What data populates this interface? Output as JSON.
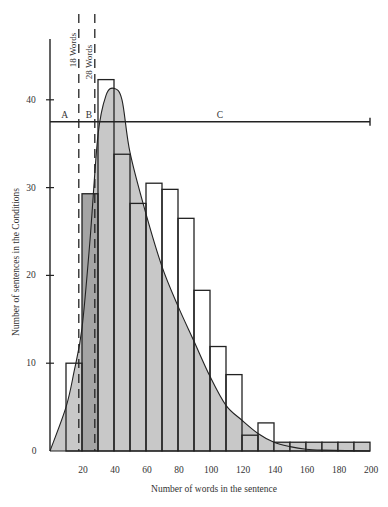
{
  "chart_data": {
    "type": "bar",
    "title": "",
    "xlabel": "Number of words in the sentence",
    "ylabel": "Number of sentences in the Conditions",
    "xlim": [
      0,
      200
    ],
    "ylim": [
      0,
      45
    ],
    "xticks": [
      20,
      40,
      60,
      80,
      100,
      120,
      140,
      160,
      180,
      200
    ],
    "yticks": [
      0,
      10,
      20,
      30,
      40
    ],
    "bins": [
      {
        "start": 10,
        "end": 20,
        "value": 10
      },
      {
        "start": 20,
        "end": 30,
        "value": 29.3
      },
      {
        "start": 30,
        "end": 40,
        "value": 42.3
      },
      {
        "start": 40,
        "end": 50,
        "value": 33.8
      },
      {
        "start": 50,
        "end": 60,
        "value": 28.2
      },
      {
        "start": 60,
        "end": 70,
        "value": 30.5
      },
      {
        "start": 70,
        "end": 80,
        "value": 29.8
      },
      {
        "start": 80,
        "end": 90,
        "value": 26.5
      },
      {
        "start": 90,
        "end": 100,
        "value": 18.3
      },
      {
        "start": 100,
        "end": 110,
        "value": 11.9
      },
      {
        "start": 110,
        "end": 120,
        "value": 8.7
      },
      {
        "start": 120,
        "end": 130,
        "value": 1.8
      },
      {
        "start": 130,
        "end": 140,
        "value": 3.2
      },
      {
        "start": 140,
        "end": 150,
        "value": 1
      },
      {
        "start": 150,
        "end": 160,
        "value": 1
      },
      {
        "start": 160,
        "end": 170,
        "value": 1
      },
      {
        "start": 170,
        "end": 180,
        "value": 1
      },
      {
        "start": 180,
        "end": 190,
        "value": 1
      },
      {
        "start": 190,
        "end": 200,
        "value": 1
      }
    ],
    "density_curve": {
      "x": [
        0,
        10,
        15,
        20,
        25,
        30,
        35,
        40,
        45,
        50,
        60,
        70,
        80,
        90,
        100,
        110,
        120,
        130,
        140,
        150,
        160,
        170,
        200
      ],
      "y": [
        0,
        5,
        9,
        14,
        24,
        36,
        40.5,
        41.3,
        40,
        34,
        27,
        21,
        16.5,
        12.5,
        8.5,
        5.2,
        3.5,
        2,
        1,
        0.5,
        0.2,
        0.1,
        0
      ]
    },
    "highlighted_bin": {
      "start": 20,
      "end": 30
    },
    "reference_lines": [
      {
        "x": 18,
        "label": "18 Words",
        "style": "dashed"
      },
      {
        "x": 28,
        "label": "28 Words",
        "style": "dashed"
      }
    ],
    "range_line": {
      "y": 37.5,
      "x_end": 200
    },
    "region_labels": [
      {
        "label": "A",
        "x": 8
      },
      {
        "label": "B",
        "x": 23
      },
      {
        "label": "C",
        "x": 105
      }
    ],
    "grid": false,
    "legend": null
  },
  "colors": {
    "fill": "#c8c8c8",
    "highlight_fill": "#a4a4a4",
    "stroke": "#222222"
  }
}
